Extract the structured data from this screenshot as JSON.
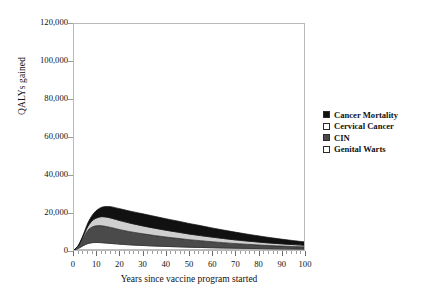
{
  "chart_data": {
    "type": "area",
    "stacked": true,
    "title": "",
    "xlabel": "Years since vaccine program started",
    "ylabel": "QALYs gained",
    "xlim": [
      0,
      100
    ],
    "ylim": [
      0,
      120000
    ],
    "xticks": [
      0,
      10,
      20,
      30,
      40,
      50,
      60,
      70,
      80,
      90,
      100
    ],
    "xtick_labels": [
      "0",
      "10",
      "20",
      "30",
      "40",
      "50",
      "60",
      "70",
      "80",
      "90",
      "100"
    ],
    "yticks": [
      0,
      20000,
      40000,
      60000,
      80000,
      100000,
      120000
    ],
    "ytick_labels": [
      "0",
      "20,000",
      "40,000",
      "60,000",
      "80,000",
      "100,000",
      "120,000"
    ],
    "x_minor_tick_interval": 2,
    "grid": false,
    "legend_position": "right",
    "x": [
      0,
      2,
      4,
      6,
      8,
      10,
      12,
      14,
      16,
      18,
      20,
      25,
      30,
      35,
      40,
      45,
      50,
      55,
      60,
      65,
      70,
      75,
      80,
      85,
      90,
      95,
      100
    ],
    "series": [
      {
        "name": "Genital Warts",
        "color": "#fdfdfd",
        "edge_color": "#3a3a3a",
        "values": [
          0,
          900,
          2300,
          3400,
          3900,
          4000,
          3900,
          3700,
          3500,
          3300,
          3100,
          2700,
          2400,
          2100,
          1900,
          1700,
          1500,
          1350,
          1200,
          1050,
          950,
          850,
          750,
          680,
          600,
          540,
          480
        ]
      },
      {
        "name": "CIN",
        "color": "#4a4a4a",
        "edge_color": "#2b2b2b",
        "values": [
          0,
          1400,
          4200,
          7000,
          8400,
          8900,
          9000,
          8800,
          8500,
          8100,
          7700,
          6900,
          6200,
          5600,
          5000,
          4500,
          4000,
          3600,
          3200,
          2850,
          2500,
          2200,
          1950,
          1700,
          1500,
          1300,
          1150
        ]
      },
      {
        "name": "Cervical Cancer",
        "color": "#cfcfcf",
        "edge_color": "#2b2b2b",
        "values": [
          0,
          200,
          900,
          2100,
          3300,
          4200,
          4800,
          5000,
          5000,
          4900,
          4800,
          4500,
          4200,
          3900,
          3600,
          3300,
          3000,
          2700,
          2450,
          2200,
          1950,
          1750,
          1550,
          1350,
          1200,
          1050,
          900
        ]
      },
      {
        "name": "Cancer Mortality",
        "color": "#111111",
        "edge_color": "#111111",
        "values": [
          0,
          150,
          700,
          1800,
          3000,
          4100,
          5000,
          5600,
          6000,
          6200,
          6300,
          6400,
          6400,
          6300,
          6100,
          5900,
          5600,
          5300,
          4900,
          4500,
          4100,
          3700,
          3300,
          2900,
          2500,
          2150,
          1800
        ]
      }
    ],
    "stack_order_bottom_to_top": [
      "Genital Warts",
      "CIN",
      "Cervical Cancer",
      "Cancer Mortality"
    ],
    "peak": {
      "x": 13,
      "total": 25200
    }
  },
  "legend": {
    "items": [
      {
        "label": "Cancer Mortality",
        "swatch": "#111111"
      },
      {
        "label": "Cervical Cancer",
        "swatch": "#ffffff"
      },
      {
        "label": "CIN",
        "swatch": "#4a4a4a"
      },
      {
        "label": "Genital Warts",
        "swatch": "#ffffff"
      }
    ]
  },
  "colors": {
    "frame": "#b9b9b9",
    "tick": "#9e9e9e",
    "text": "#111111",
    "background": "#ffffff"
  }
}
